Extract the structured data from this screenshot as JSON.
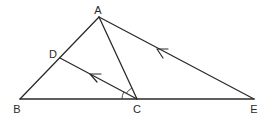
{
  "diagram": {
    "type": "geometry-figure",
    "points": {
      "A": {
        "label": "A",
        "x": 99,
        "y": 17,
        "lx": 98,
        "ly": 14
      },
      "B": {
        "label": "B",
        "x": 20,
        "y": 99,
        "lx": 17,
        "ly": 113
      },
      "C": {
        "label": "C",
        "x": 137,
        "y": 99,
        "lx": 137,
        "ly": 113
      },
      "D": {
        "label": "D",
        "x": 60,
        "y": 58,
        "lx": 53,
        "ly": 58
      },
      "E": {
        "label": "E",
        "x": 254,
        "y": 99,
        "lx": 254,
        "ly": 113
      }
    },
    "segments": [
      "AB",
      "AE",
      "BE",
      "AC",
      "DC"
    ],
    "parallel_marks": [
      {
        "segment": "DC",
        "description": "arrow pointing toward D"
      },
      {
        "segment": "AE",
        "description": "arrow pointing toward A"
      }
    ],
    "angle_marks": [
      {
        "vertex": "C",
        "between": [
          "D",
          "A"
        ],
        "description": "single arc, angle DCA"
      },
      {
        "vertex": "C",
        "between": [
          "B",
          "D"
        ],
        "description": "single arc, angle BCD"
      }
    ],
    "stroke_color": "#2b2b2b",
    "background": "#ffffff"
  }
}
